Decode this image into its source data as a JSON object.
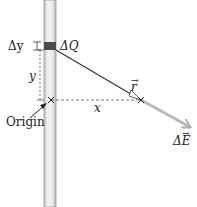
{
  "diagram": {
    "title": "",
    "labels": {
      "delta_y": "Δy",
      "delta_q": "ΔQ",
      "y": "y",
      "x": "x",
      "r": "r",
      "origin": "Origin",
      "delta_e": "ΔE"
    },
    "elements": {
      "rod": "vertical charged rod",
      "charge_segment": "small charge element ΔQ",
      "origin_marker": "×",
      "field_point_marker": "×",
      "r_vector": "vector r from ΔQ to field point",
      "e_vector": "field contribution ΔE along r"
    },
    "colors": {
      "rod_fill": "#e6e6e6",
      "rod_edge": "#9a9a9a",
      "segment": "#4a4a4a",
      "r_line": "#333333",
      "e_arrow": "#b8b8b8",
      "dashed": "#555555"
    }
  }
}
